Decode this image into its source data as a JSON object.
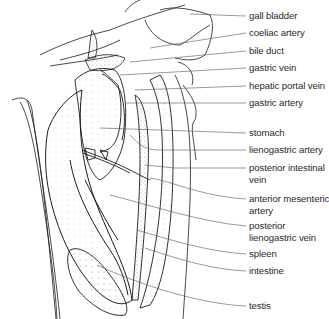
{
  "diagram": {
    "line_color": "#1a1a1a",
    "leader_color": "#555555",
    "labels": [
      {
        "id": "gall-bladder",
        "lines": [
          "gall bladder"
        ],
        "y": 10,
        "leader": {
          "x1": 190,
          "y1": 14,
          "x2": 246,
          "y2": 16
        }
      },
      {
        "id": "coeliac-artery",
        "lines": [
          "coeliac artery"
        ],
        "y": 27,
        "leader": {
          "x1": 150,
          "y1": 48,
          "x2": 246,
          "y2": 33
        }
      },
      {
        "id": "bile-duct",
        "lines": [
          "bile duct"
        ],
        "y": 45,
        "leader": {
          "x1": 130,
          "y1": 62,
          "x2": 246,
          "y2": 51
        }
      },
      {
        "id": "gastric-vein",
        "lines": [
          "gastric vein"
        ],
        "y": 62,
        "leader": {
          "x1": 120,
          "y1": 75,
          "x2": 246,
          "y2": 68
        }
      },
      {
        "id": "hepatic-portal-vein",
        "lines": [
          "hepatic portal vein"
        ],
        "y": 80,
        "leader": {
          "x1": 135,
          "y1": 90,
          "x2": 246,
          "y2": 86
        }
      },
      {
        "id": "gastric-artery",
        "lines": [
          "gastric artery"
        ],
        "y": 97,
        "leader": {
          "x1": 125,
          "y1": 103,
          "x2": 246,
          "y2": 103
        }
      },
      {
        "id": "stomach",
        "lines": [
          "stomach"
        ],
        "y": 127,
        "leader": {
          "x1": 100,
          "y1": 128,
          "x2": 246,
          "y2": 133
        }
      },
      {
        "id": "lienogastric-artery",
        "lines": [
          "lienogastric artery"
        ],
        "y": 144,
        "leader": {
          "x1": 130,
          "y1": 150,
          "x2": 246,
          "y2": 150
        }
      },
      {
        "id": "posterior-intestinal-vein",
        "lines": [
          "posterior intestinal",
          "vein"
        ],
        "y": 162,
        "leader": {
          "x1": 145,
          "y1": 165,
          "x2": 246,
          "y2": 168
        }
      },
      {
        "id": "anterior-mesenteric-artery",
        "lines": [
          "anterior mesenteric",
          "artery"
        ],
        "y": 193,
        "leader": {
          "x1": 150,
          "y1": 178,
          "x2": 246,
          "y2": 199
        }
      },
      {
        "id": "posterior-lienogastric-vein",
        "lines": [
          "posterior",
          "lienogastric vein"
        ],
        "y": 220,
        "leader": {
          "x1": 110,
          "y1": 195,
          "x2": 246,
          "y2": 226
        }
      },
      {
        "id": "spleen",
        "lines": [
          "spleen"
        ],
        "y": 248,
        "leader": {
          "x1": 137,
          "y1": 230,
          "x2": 246,
          "y2": 254
        }
      },
      {
        "id": "intestine",
        "lines": [
          "intestine"
        ],
        "y": 265,
        "leader": {
          "x1": 145,
          "y1": 248,
          "x2": 246,
          "y2": 271
        }
      },
      {
        "id": "testis",
        "lines": [
          "testis"
        ],
        "y": 300,
        "leader": {
          "x1": 97,
          "y1": 265,
          "x2": 246,
          "y2": 306
        }
      }
    ]
  }
}
